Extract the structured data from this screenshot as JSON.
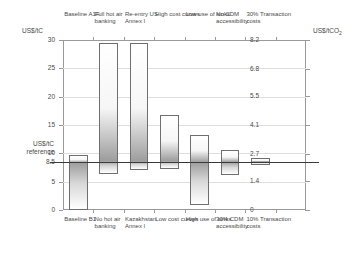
{
  "chart_data": {
    "type": "bar",
    "title": "",
    "subtitle": "",
    "ylabel": "US$/tC",
    "ylabel_right": "US$/tCO2",
    "xlabel": "",
    "ylim": [
      0,
      30
    ],
    "ylim_right": [
      0,
      8.2
    ],
    "grid": true,
    "legend": "none",
    "reference_value": 8.5,
    "reference_label_lines": [
      "US$/tC",
      "reference"
    ],
    "left_ticks": [
      "30",
      "25",
      "20",
      "15",
      "10",
      "8.5",
      "5",
      "0"
    ],
    "left_tick_values": [
      30,
      25,
      20,
      15,
      10,
      8.5,
      5,
      0
    ],
    "right_ticks": [
      "8.2",
      "6.8",
      "5.5",
      "4.1",
      "2.7",
      "1.4",
      "0"
    ],
    "right_tick_values": [
      8.2,
      6.8,
      5.5,
      4.1,
      2.7,
      1.4,
      0
    ],
    "categories_top": [
      "Baseline A1F",
      "Full hot air banking",
      "Re-entry US Annex I",
      "High cost curves",
      "Low use of sinks",
      "No CDM accessibility",
      "30% Transaction costs"
    ],
    "categories_bottom": [
      "Baseline B1",
      "No hot air banking",
      "Kazakhstan Annex I",
      "Low cost curves",
      "High use of sinks",
      "30% CDM accessibility",
      "10% Transaction costs"
    ],
    "series": [
      {
        "name": "Sensitivity range (US$/tC)",
        "bars": [
          {
            "label_top": "Baseline A1F",
            "label_bottom": "Baseline B1",
            "low": 0.0,
            "high": 9.7
          },
          {
            "label_top": "Full hot air banking",
            "label_bottom": "No hot air banking",
            "low": 6.3,
            "high": 29.5
          },
          {
            "label_top": "Re-entry US Annex I",
            "label_bottom": "Kazakhstan Annex I",
            "low": 7.1,
            "high": 29.5
          },
          {
            "label_top": "High cost curves",
            "label_bottom": "Low cost curves",
            "low": 7.2,
            "high": 16.8
          },
          {
            "label_top": "Low use of sinks",
            "label_bottom": "High use of sinks",
            "low": 0.9,
            "high": 13.3
          },
          {
            "label_top": "No CDM accessibility",
            "label_bottom": "30% CDM accessibility",
            "low": 6.2,
            "high": 10.6
          },
          {
            "label_top": "30% Transaction costs",
            "label_bottom": "10% Transaction costs",
            "low": 7.9,
            "high": 9.2
          }
        ]
      }
    ]
  },
  "axes": {
    "left_title": "US$/tC",
    "right_title": "US$/tCO",
    "right_title_sub": "2"
  }
}
